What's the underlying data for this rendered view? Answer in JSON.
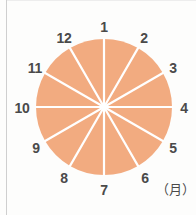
{
  "figure": {
    "width": 196,
    "height": 215,
    "background_color": "#fdfdfc",
    "border_color": "#cfcfcf"
  },
  "unit": {
    "label": "（月）"
  },
  "chart_data": {
    "type": "pie",
    "title": "",
    "subtitle": "",
    "xlabel": "",
    "ylabel": "",
    "unit_label": "（月）",
    "legend_position": "none",
    "grid": false,
    "categories": [
      "1",
      "2",
      "3",
      "4",
      "5",
      "6",
      "7",
      "8",
      "9",
      "10",
      "11",
      "12"
    ],
    "values": [
      1,
      1,
      1,
      1,
      1,
      1,
      1,
      1,
      1,
      1,
      1,
      1
    ],
    "percentages": [
      8.33,
      8.33,
      8.33,
      8.33,
      8.33,
      8.33,
      8.33,
      8.33,
      8.33,
      8.33,
      8.33,
      8.33
    ],
    "slice_angle_degrees": 30,
    "start_angle_degrees": -90,
    "direction": "clockwise",
    "slice_color": "#f2ab80",
    "divider_color": "#ffffff",
    "label_color": "#4a4a4a",
    "center": {
      "x": 104,
      "y": 107
    },
    "radius": 68,
    "labels": [
      {
        "text": "1",
        "x": 104,
        "y": 27,
        "angle": -90
      },
      {
        "text": "2",
        "x": 144,
        "y": 38,
        "angle": -60
      },
      {
        "text": "3",
        "x": 173,
        "y": 68,
        "angle": -30
      },
      {
        "text": "4",
        "x": 184,
        "y": 108,
        "angle": 0
      },
      {
        "text": "5",
        "x": 173,
        "y": 148,
        "angle": 30
      },
      {
        "text": "6",
        "x": 145,
        "y": 178,
        "angle": 60
      },
      {
        "text": "7",
        "x": 104,
        "y": 190,
        "angle": 90
      },
      {
        "text": "8",
        "x": 64,
        "y": 178,
        "angle": 120
      },
      {
        "text": "9",
        "x": 36,
        "y": 148,
        "angle": 150
      },
      {
        "text": "10",
        "x": 22,
        "y": 108,
        "angle": 180
      },
      {
        "text": "11",
        "x": 35,
        "y": 68,
        "angle": 210
      },
      {
        "text": "12",
        "x": 64,
        "y": 38,
        "angle": 240
      }
    ]
  }
}
